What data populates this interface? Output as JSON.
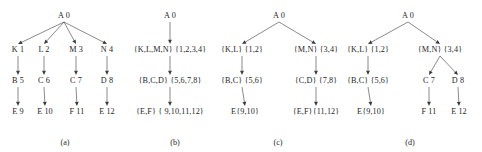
{
  "figure": {
    "type": "diagram",
    "panels": [
      {
        "caption": "(a)",
        "nodes": [
          {
            "id": "a-root",
            "label": "A 0",
            "x": 64,
            "y": 16
          },
          {
            "id": "a-k",
            "label": "K 1",
            "x": 18,
            "y": 50
          },
          {
            "id": "a-l",
            "label": "L 2",
            "x": 44,
            "y": 50
          },
          {
            "id": "a-m",
            "label": "M 3",
            "x": 76,
            "y": 50
          },
          {
            "id": "a-n",
            "label": "N 4",
            "x": 107,
            "y": 50
          },
          {
            "id": "a-b",
            "label": "B 5",
            "x": 18,
            "y": 81
          },
          {
            "id": "a-c6",
            "label": "C 6",
            "x": 44,
            "y": 81
          },
          {
            "id": "a-c7",
            "label": "C 7",
            "x": 76,
            "y": 81
          },
          {
            "id": "a-d",
            "label": "D 8",
            "x": 107,
            "y": 81
          },
          {
            "id": "a-e9",
            "label": "E 9",
            "x": 18,
            "y": 112
          },
          {
            "id": "a-e10",
            "label": "E 10",
            "x": 45,
            "y": 112
          },
          {
            "id": "a-f11",
            "label": "F 11",
            "x": 77,
            "y": 112
          },
          {
            "id": "a-e12",
            "label": "E 12",
            "x": 107,
            "y": 112
          }
        ],
        "edges": [
          {
            "from": "a-root",
            "to": "a-k"
          },
          {
            "from": "a-root",
            "to": "a-l"
          },
          {
            "from": "a-root",
            "to": "a-m"
          },
          {
            "from": "a-root",
            "to": "a-n"
          },
          {
            "from": "a-k",
            "to": "a-b"
          },
          {
            "from": "a-l",
            "to": "a-c6"
          },
          {
            "from": "a-m",
            "to": "a-c7"
          },
          {
            "from": "a-n",
            "to": "a-d"
          },
          {
            "from": "a-b",
            "to": "a-e9"
          },
          {
            "from": "a-c6",
            "to": "a-e10"
          },
          {
            "from": "a-c7",
            "to": "a-f11"
          },
          {
            "from": "a-d",
            "to": "a-e12"
          }
        ]
      },
      {
        "caption": "(b)",
        "nodes": [
          {
            "id": "b-root",
            "label": "A 0",
            "x": 50,
            "y": 16
          },
          {
            "id": "b-l1",
            "label": "{K,L,M,N}  {1,2,3,4}",
            "x": 50,
            "y": 50
          },
          {
            "id": "b-l2",
            "label": "{B,C,D}  {5,6,7,8}",
            "x": 50,
            "y": 81
          },
          {
            "id": "b-l3",
            "label": "{E,F} { 9,10,11,12}",
            "x": 50,
            "y": 112
          }
        ],
        "edges": [
          {
            "from": "b-root",
            "to": "b-l1"
          },
          {
            "from": "b-l1",
            "to": "b-l2"
          },
          {
            "from": "b-l2",
            "to": "b-l3"
          }
        ]
      },
      {
        "caption": "(c)",
        "nodes": [
          {
            "id": "c-root",
            "label": "A 0",
            "x": 64,
            "y": 16
          },
          {
            "id": "c-kl",
            "label": "{K,L} {1,2}",
            "x": 27,
            "y": 50
          },
          {
            "id": "c-mn",
            "label": "{M,N} {3,4}",
            "x": 101,
            "y": 50
          },
          {
            "id": "c-bc",
            "label": "{B,C} {5,6}",
            "x": 27,
            "y": 81
          },
          {
            "id": "c-cd",
            "label": "{C,D} {7,8}",
            "x": 101,
            "y": 81
          },
          {
            "id": "c-e",
            "label": "E{9,10}",
            "x": 30,
            "y": 112
          },
          {
            "id": "c-ef",
            "label": "{E,F}{11,12}",
            "x": 101,
            "y": 112
          }
        ],
        "edges": [
          {
            "from": "c-root",
            "to": "c-kl"
          },
          {
            "from": "c-root",
            "to": "c-mn"
          },
          {
            "from": "c-kl",
            "to": "c-bc"
          },
          {
            "from": "c-mn",
            "to": "c-cd"
          },
          {
            "from": "c-bc",
            "to": "c-e"
          },
          {
            "from": "c-cd",
            "to": "c-ef"
          }
        ]
      },
      {
        "caption": "(d)",
        "nodes": [
          {
            "id": "d-root",
            "label": "A 0",
            "x": 68,
            "y": 16
          },
          {
            "id": "d-kl",
            "label": "{K,L} {1,2}",
            "x": 28,
            "y": 50
          },
          {
            "id": "d-mn",
            "label": "{M,N} {3,4}",
            "x": 100,
            "y": 50
          },
          {
            "id": "d-bc",
            "label": "{B,C} {5,6}",
            "x": 28,
            "y": 81
          },
          {
            "id": "d-c7",
            "label": "C 7",
            "x": 89,
            "y": 81
          },
          {
            "id": "d-d8",
            "label": "D 8",
            "x": 118,
            "y": 81
          },
          {
            "id": "d-e",
            "label": "E{9,10}",
            "x": 31,
            "y": 112
          },
          {
            "id": "d-f11",
            "label": "F 11",
            "x": 89,
            "y": 112
          },
          {
            "id": "d-e12",
            "label": "E 12",
            "x": 119,
            "y": 112
          }
        ],
        "edges": [
          {
            "from": "d-root",
            "to": "d-kl"
          },
          {
            "from": "d-root",
            "to": "d-mn"
          },
          {
            "from": "d-kl",
            "to": "d-bc"
          },
          {
            "from": "d-mn",
            "to": "d-c7"
          },
          {
            "from": "d-mn",
            "to": "d-d8"
          },
          {
            "from": "d-bc",
            "to": "d-e"
          },
          {
            "from": "d-c7",
            "to": "d-f11"
          },
          {
            "from": "d-d8",
            "to": "d-e12"
          }
        ]
      }
    ],
    "caption_positions": [
      {
        "panel": 0,
        "x": 65,
        "y": 138
      },
      {
        "panel": 1,
        "x": 55,
        "y": 138
      },
      {
        "panel": 2,
        "x": 63,
        "y": 138
      },
      {
        "panel": 3,
        "x": 70,
        "y": 138
      }
    ],
    "style": {
      "edge_color": "#3a3a3a",
      "text_color": "#1f1f1f",
      "background": "#ffffff"
    }
  }
}
